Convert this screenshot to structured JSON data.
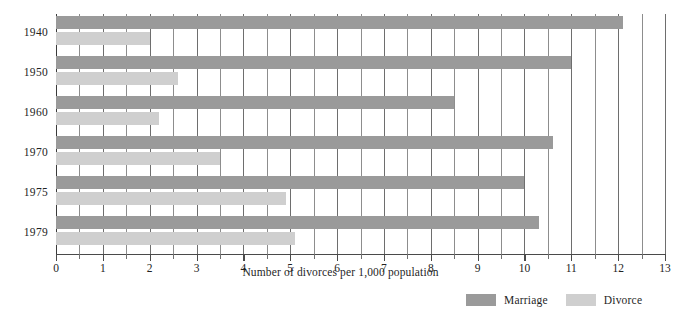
{
  "chart_data": {
    "type": "bar",
    "orientation": "horizontal",
    "title": "",
    "xlabel": "Number of divorces per 1,000 population",
    "ylabel": "",
    "categories": [
      "1940",
      "1950",
      "1960",
      "1970",
      "1975",
      "1979"
    ],
    "series": [
      {
        "name": "Marriage",
        "color": "#9a9a9a",
        "values": [
          12.1,
          11.0,
          8.5,
          10.6,
          10.0,
          10.3
        ]
      },
      {
        "name": "Divorce",
        "color": "#cfcfcf",
        "values": [
          2.0,
          2.6,
          2.2,
          3.5,
          4.9,
          5.1
        ]
      }
    ],
    "xlim": [
      0,
      13
    ],
    "xticks": [
      0,
      1,
      2,
      3,
      4,
      5,
      6,
      7,
      8,
      9,
      10,
      11,
      12,
      13
    ],
    "xtick_labels": [
      "0",
      "1",
      "2",
      "3",
      "4",
      "5",
      "6",
      "7",
      "8",
      "9",
      "10",
      "11",
      "12",
      "13"
    ],
    "minor_tick_step": 0.5,
    "grid": "vertical-minor-and-major",
    "legend_position": "bottom-right"
  },
  "legend": {
    "items": [
      {
        "label": "Marriage",
        "color": "#9a9a9a"
      },
      {
        "label": "Divorce",
        "color": "#cfcfcf"
      }
    ]
  },
  "axis": {
    "title": "Number of divorces per 1,000 population"
  }
}
